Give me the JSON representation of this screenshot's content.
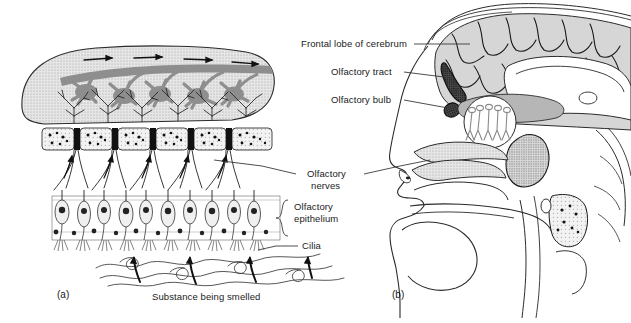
{
  "figure": {
    "background": "#ffffff",
    "panels": [
      {
        "id": "a",
        "label": "(a)",
        "caption": "Olfactory epithelium and bulb detail"
      },
      {
        "id": "b",
        "label": "(b)",
        "caption": "Sagittal section of head"
      }
    ]
  },
  "labels": {
    "frontal_lobe": "Frontal lobe of cerebrum",
    "olfactory_tract": "Olfactory tract",
    "olfactory_bulb": "Olfactory bulb",
    "olfactory_nerves_line1": "Olfactory",
    "olfactory_nerves_line2": "nerves",
    "olfactory_epithelium_line1": "Olfactory",
    "olfactory_epithelium_line2": "epithelium",
    "cilia": "Cilia",
    "substance": "Substance being smelled",
    "panel_a": "(a)",
    "panel_b": "(b)"
  },
  "colors": {
    "ink": "#1a1a1a",
    "line": "#2b2b2b",
    "brain_gray": "#d6d6d6",
    "bulb_stipple": "#cfcfcf",
    "mitral_gray": "#8e8e8e",
    "tract_dark": "#2a2a2a",
    "bone_fill": "#f4f4f4",
    "background": "#ffffff",
    "leader": "#3a3a3a"
  },
  "structures": {
    "panel_a": [
      "olfactory bulb outer stippled capsule",
      "mitral cells (gray star-shaped neurons)",
      "olfactory tract axon bundle with directional arrows",
      "glomeruli / dendritic tufts",
      "cribriform plate of ethmoid bone with bone cells",
      "olfactory nerve axon bundles passing through foramina",
      "olfactory receptor cells (bipolar neurons)",
      "supporting cells and basal cells",
      "cilia projecting into mucus",
      "odorant molecules rising as wavy lines with arrows"
    ],
    "panel_b": [
      "frontal lobe of cerebrum (gray, gyri and sulci)",
      "corpus callosum",
      "olfactory tract (dark elongated)",
      "olfactory bulb (dark oval)",
      "magnified circle of olfactory nerves through cribriform plate",
      "nasal conchae / turbinates",
      "sphenoid sinus",
      "hard palate",
      "tongue",
      "cervical vertebrae",
      "nostril and nasal vestibule"
    ]
  },
  "arrows": {
    "tract_direction_count": 4,
    "nerve_direction_count": 6,
    "odor_arrow_count": 4
  }
}
